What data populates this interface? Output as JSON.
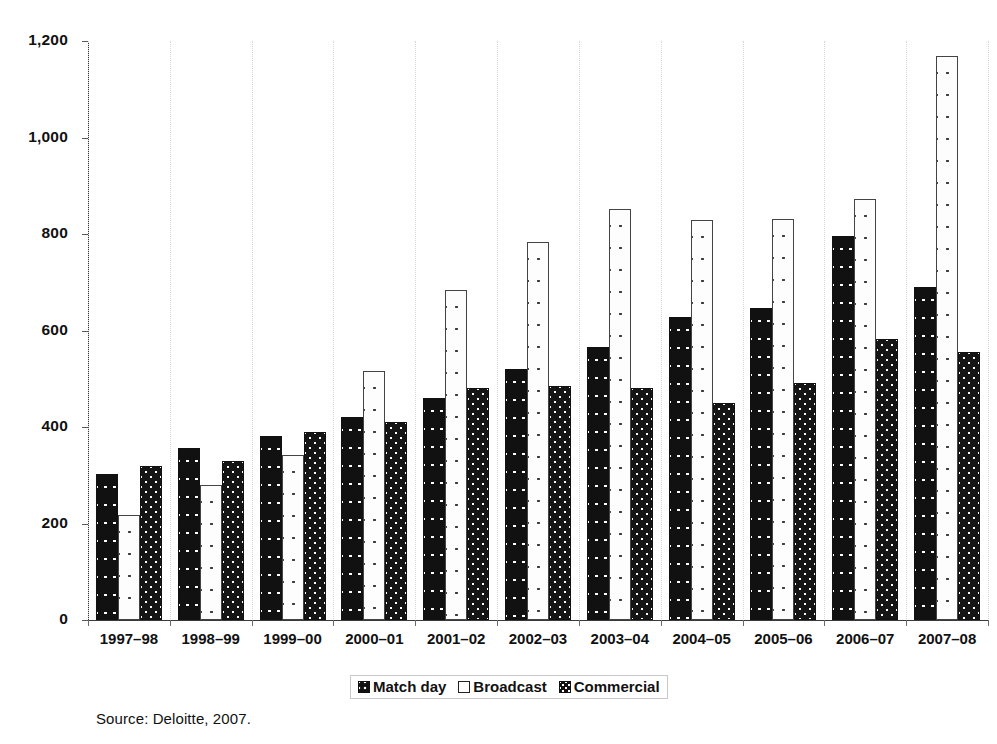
{
  "figure": {
    "source_note": "Source: Deloitte, 2007."
  },
  "legend": {
    "position": "bottom-center",
    "items": [
      {
        "label": "Match day",
        "swatch": "matchday-swatch-icon"
      },
      {
        "label": "Broadcast",
        "swatch": "broadcast-swatch-icon"
      },
      {
        "label": "Commercial",
        "swatch": "commercial-swatch-icon"
      }
    ]
  },
  "chart_data": {
    "type": "bar",
    "title": "",
    "subtitle": "",
    "xlabel": "",
    "ylabel": "",
    "ylim": [
      0,
      1200
    ],
    "ytick_values": [
      0,
      200,
      400,
      600,
      800,
      1000,
      1200
    ],
    "ytick_labels": [
      "0",
      "200",
      "400",
      "600",
      "800",
      "1,000",
      "1,200"
    ],
    "grid": true,
    "grid_axis": "x",
    "legend_position": "bottom",
    "categories": [
      "1997–98",
      "1998–99",
      "1999–00",
      "2000–01",
      "2001–02",
      "2002–03",
      "2003–04",
      "2004–05",
      "2005–06",
      "2006–07",
      "2007–08"
    ],
    "series": [
      {
        "name": "Match day",
        "values": [
          303,
          357,
          381,
          420,
          461,
          521,
          566,
          627,
          647,
          795,
          690
        ]
      },
      {
        "name": "Broadcast",
        "values": [
          218,
          280,
          343,
          517,
          683,
          783,
          852,
          830,
          831,
          872,
          1168
        ]
      },
      {
        "name": "Commercial",
        "values": [
          320,
          330,
          389,
          410,
          480,
          485,
          481,
          449,
          491,
          583,
          555
        ]
      }
    ],
    "annotations": []
  }
}
